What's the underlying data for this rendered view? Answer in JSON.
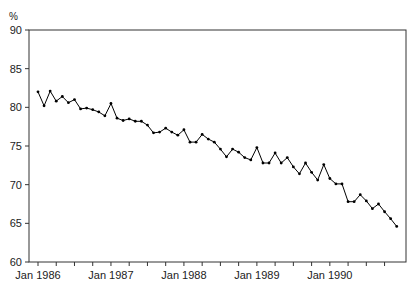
{
  "chart_data": {
    "type": "line",
    "title": "",
    "xlabel": "",
    "ylabel": "%",
    "ylim": [
      60,
      90
    ],
    "yticks": [
      60,
      65,
      70,
      75,
      80,
      85,
      90
    ],
    "xtick_labels": [
      "Jan 1986",
      "Jan 1987",
      "Jan 1988",
      "Jan 1989",
      "Jan 1990"
    ],
    "x_minor_ticks": "quarterly",
    "grid": false,
    "legend": null,
    "x_start": "Jan 1986",
    "x_end": "Dec 1990",
    "frequency": "monthly",
    "series": [
      {
        "name": "%",
        "color": "#000000",
        "marker": "dot",
        "values": [
          82.0,
          80.2,
          82.1,
          80.8,
          81.4,
          80.6,
          81.0,
          79.8,
          79.9,
          79.7,
          79.4,
          78.9,
          80.5,
          78.6,
          78.3,
          78.5,
          78.2,
          78.2,
          77.7,
          76.7,
          76.8,
          77.3,
          76.8,
          76.4,
          77.1,
          75.5,
          75.5,
          76.5,
          75.9,
          75.5,
          74.6,
          73.6,
          74.6,
          74.2,
          73.5,
          73.2,
          74.8,
          72.8,
          72.8,
          74.1,
          72.8,
          73.5,
          72.3,
          71.4,
          72.8,
          71.6,
          70.6,
          72.6,
          70.8,
          70.1,
          70.1,
          67.8,
          67.8,
          68.7,
          67.9,
          66.9,
          67.5,
          66.5,
          65.6,
          64.6
        ]
      }
    ]
  }
}
